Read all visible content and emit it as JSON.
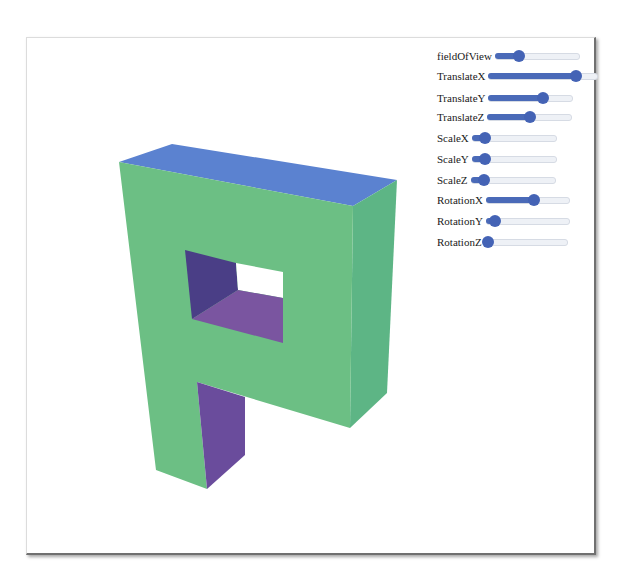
{
  "canvas": {
    "shape": "letter-F-3d-extruded",
    "colors": {
      "front": "#6cbf84",
      "side": "#5cb686",
      "top": "#5b82d0",
      "hole_left": "#4a3e86",
      "hole_floor": "#7a55a0",
      "stem_inner": "#6a4c9c",
      "background": "#ffffff"
    }
  },
  "controls": {
    "accent_color": "#4463b5",
    "sliders": [
      {
        "label": "fieldOfView",
        "value": 0.28
      },
      {
        "label": "TranslateX",
        "value": 0.8
      },
      {
        "label": "TranslateY",
        "value": 0.64
      },
      {
        "label": "TranslateZ",
        "value": 0.5
      },
      {
        "label": "ScaleX",
        "value": 0.16
      },
      {
        "label": "ScaleY",
        "value": 0.16
      },
      {
        "label": "ScaleZ",
        "value": 0.16
      },
      {
        "label": "RotationX",
        "value": 0.57
      },
      {
        "label": "RotationY",
        "value": 0.11
      },
      {
        "label": "RotationZ",
        "value": 0.04
      }
    ]
  }
}
